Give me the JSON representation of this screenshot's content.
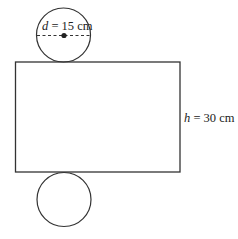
{
  "diagram": {
    "type": "cylinder-net",
    "top_circle": {
      "label_var": "d",
      "label_rest": " = 15 cm",
      "diameter": "15 cm"
    },
    "rectangle": {
      "label_var": "h",
      "label_rest": " = 30 cm",
      "height": "30 cm"
    },
    "bottom_circle": {},
    "colors": {
      "stroke": "#333333",
      "text": "#222222",
      "background": "#ffffff"
    }
  }
}
